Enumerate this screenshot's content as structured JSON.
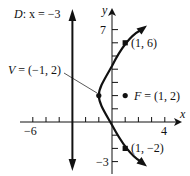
{
  "figure": {
    "type": "parabola-diagram",
    "equation_note": "(y-2)^2 = 8(x+1)",
    "axes": {
      "x_label": "x",
      "y_label": "y",
      "x_tick_labels": [
        {
          "value": -6,
          "label": "−6"
        },
        {
          "value": 4,
          "label": "4"
        }
      ],
      "y_tick_labels": [
        {
          "value": 7,
          "label": "7"
        },
        {
          "value": -3,
          "label": "−3"
        }
      ],
      "x_ticks": [
        -6,
        -5,
        -4,
        -3,
        -2,
        -1,
        1,
        2,
        3,
        4
      ],
      "y_ticks": [
        -3,
        -2,
        -1,
        1,
        2,
        3,
        4,
        5,
        6,
        7
      ]
    },
    "directrix": {
      "label_prefix": "D",
      "label_rest": ": x = −3",
      "x": -3
    },
    "vertex": {
      "label_prefix": "V",
      "label_rest": " = (−1, 2)",
      "x": -1,
      "y": 2
    },
    "focus": {
      "label_prefix": "F",
      "label_rest": " = (1, 2)",
      "x": 1,
      "y": 2
    },
    "points": [
      {
        "label": "(1, 6)",
        "x": 1,
        "y": 6
      },
      {
        "label": "(1, −2)",
        "x": 1,
        "y": -2
      }
    ],
    "colors": {
      "ink": "#111111",
      "background": "#ffffff"
    }
  }
}
